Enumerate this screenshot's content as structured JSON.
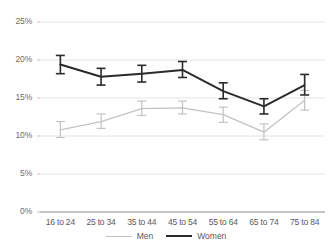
{
  "chart_data": {
    "type": "line",
    "title": "",
    "xlabel": "",
    "ylabel": "",
    "categories": [
      "16 to 24",
      "25 to 34",
      "35 to 44",
      "45 to 54",
      "55 to 64",
      "65 to 74",
      "75 to 84"
    ],
    "ylim": [
      0,
      25
    ],
    "yticks": [
      "0%",
      "5%",
      "10%",
      "15%",
      "20%",
      "25%"
    ],
    "ytick_values": [
      0,
      5,
      10,
      15,
      20,
      25
    ],
    "grid": true,
    "legend_position": "bottom",
    "error_bars": true,
    "series": [
      {
        "name": "Men",
        "color": "#c2c2c2",
        "values": [
          10.8,
          11.9,
          13.6,
          13.7,
          12.8,
          10.5,
          14.7
        ],
        "err_low": [
          9.8,
          11.0,
          12.7,
          12.9,
          11.8,
          9.5,
          13.4
        ],
        "err_high": [
          11.9,
          12.9,
          14.6,
          14.6,
          13.8,
          11.6,
          16.0
        ]
      },
      {
        "name": "Women",
        "color": "#2b2b2b",
        "values": [
          19.4,
          17.8,
          18.2,
          18.7,
          15.9,
          13.9,
          16.7
        ],
        "err_low": [
          18.2,
          16.7,
          17.1,
          17.7,
          14.9,
          12.9,
          15.4
        ],
        "err_high": [
          20.6,
          18.9,
          19.3,
          19.8,
          17.0,
          14.9,
          18.1
        ]
      }
    ]
  },
  "legend": {
    "items": [
      {
        "label": "Men"
      },
      {
        "label": "Women"
      }
    ]
  }
}
